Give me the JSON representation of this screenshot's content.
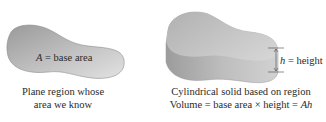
{
  "left_figure": {
    "region_label_var": "A",
    "region_label_rest": " = base area",
    "caption_line1": "Plane region whose",
    "caption_line2": "area we know"
  },
  "right_figure": {
    "height_label_var": "h",
    "height_label_rest": " = height",
    "caption_line1": "Cylindrical solid based on region",
    "caption_line2_prefix": "Volume = base area ×  height = ",
    "caption_line2_var": "Ah"
  },
  "colors": {
    "region_fill_light": "#d9d9d9",
    "region_fill_dark": "#9e9e9e",
    "cylinder_top": "#c8c8c8",
    "cylinder_side": "#b0b0b0",
    "text": "#2a2a2a"
  }
}
